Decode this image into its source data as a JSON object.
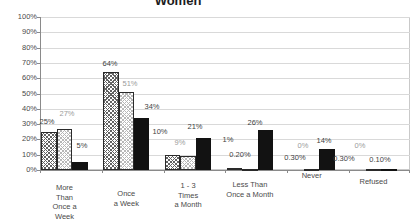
{
  "chart_data": {
    "type": "bar",
    "title": "Women",
    "categories": [
      "More Than Once a Week",
      "Once a Week",
      "1 - 3 Times a Month",
      "Less Than Once a Month",
      "Never",
      "Refused"
    ],
    "category_label_lines": [
      [
        "More",
        "Than",
        "Once a",
        "Week"
      ],
      [
        "Once",
        "a Week"
      ],
      [
        "1 - 3",
        "Times",
        "a Month"
      ],
      [
        "Less Than",
        "Once a Month"
      ],
      [
        "Never"
      ],
      [
        "Refused"
      ]
    ],
    "series": [
      {
        "name": "series-1-dark-crosshatch",
        "pattern": "crosshatch-dark",
        "values": [
          25,
          64,
          10,
          1,
          0,
          0
        ],
        "labels": [
          "25%",
          "64%",
          "10%",
          "1%",
          "0%",
          "0%"
        ]
      },
      {
        "name": "series-2-light-crosshatch",
        "pattern": "crosshatch-light",
        "values": [
          27,
          51,
          9,
          0.2,
          0.3,
          0.1
        ],
        "labels": [
          "27%",
          "51%",
          "9%",
          "0.20%",
          "0.30%",
          "0.10%"
        ]
      },
      {
        "name": "series-3-solid-black",
        "pattern": "solid-black",
        "values": [
          5,
          34,
          21,
          26,
          14,
          0.3
        ],
        "labels": [
          "5%",
          "34%",
          "21%",
          "26%",
          "14%",
          "0.30%"
        ]
      }
    ],
    "y_ticks": [
      "0%",
      "10%",
      "20%",
      "30%",
      "40%",
      "50%",
      "60%",
      "70%",
      "80%",
      "90%",
      "100%"
    ],
    "ylim": [
      0,
      100
    ],
    "ytick_step": 10,
    "xlabel": "",
    "ylabel": "",
    "grid": true,
    "legend": "none",
    "colors": {
      "solid_bar": "#121212",
      "hatch_dark_lines": "#636363",
      "hatch_light_lines": "#b8b8b8",
      "gridline": "#d9d9d9",
      "axis": "#8a8a8a",
      "label_dark": "#3f3f3f",
      "label_gray": "#9b9b9b"
    }
  }
}
